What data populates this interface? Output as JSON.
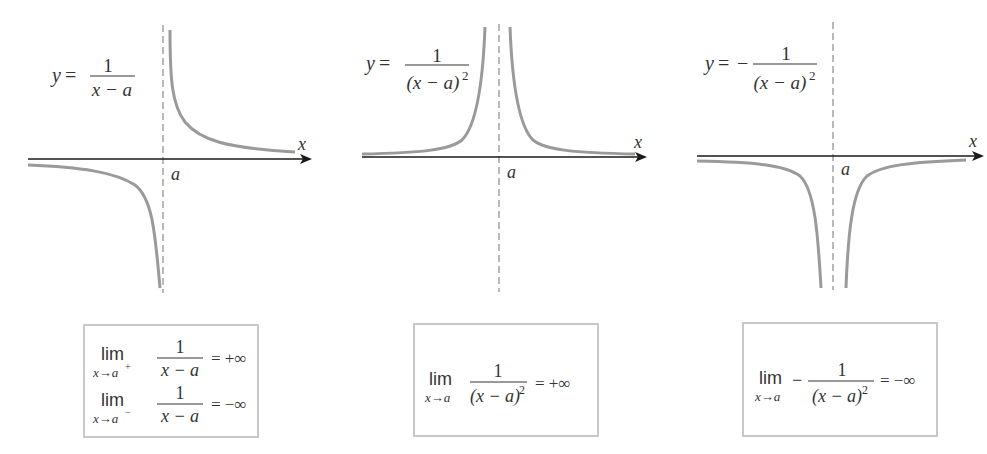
{
  "graphs": [
    {
      "equation": {
        "lhs": "y =",
        "sign": "",
        "numerator": "1",
        "denominator": "x − a",
        "exponent": ""
      },
      "x_axis_label": "x",
      "asymptote_label": "a"
    },
    {
      "equation": {
        "lhs": "y =",
        "sign": "",
        "numerator": "1",
        "denominator": "(x − a)",
        "exponent": "2"
      },
      "x_axis_label": "x",
      "asymptote_label": "a"
    },
    {
      "equation": {
        "lhs": "y =",
        "sign": "−",
        "numerator": "1",
        "denominator": "(x − a)",
        "exponent": "2"
      },
      "x_axis_label": "x",
      "asymptote_label": "a"
    }
  ],
  "limit_boxes": [
    {
      "rows": [
        {
          "lim": "lim",
          "sub": "x→a",
          "sup": "+",
          "sign": "",
          "numerator": "1",
          "denominator": "x − a",
          "exponent": "",
          "result": "= +∞"
        },
        {
          "lim": "lim",
          "sub": "x→a",
          "sup": "−",
          "sign": "",
          "numerator": "1",
          "denominator": "x − a",
          "exponent": "",
          "result": "= −∞"
        }
      ]
    },
    {
      "rows": [
        {
          "lim": "lim",
          "sub": "x→a",
          "sup": "",
          "sign": "",
          "numerator": "1",
          "denominator": "(x − a)",
          "exponent": "2",
          "result": "= +∞"
        }
      ]
    },
    {
      "rows": [
        {
          "lim": "lim",
          "sub": "x→a",
          "sup": "",
          "sign": "−",
          "numerator": "1",
          "denominator": "(x − a)",
          "exponent": "2",
          "result": "= −∞"
        }
      ]
    }
  ],
  "colors": {
    "curve": "#9a9a9a",
    "axis": "#1a1a1a",
    "asymptote": "#8a8a8a",
    "box_border": "#c8c8c8"
  }
}
